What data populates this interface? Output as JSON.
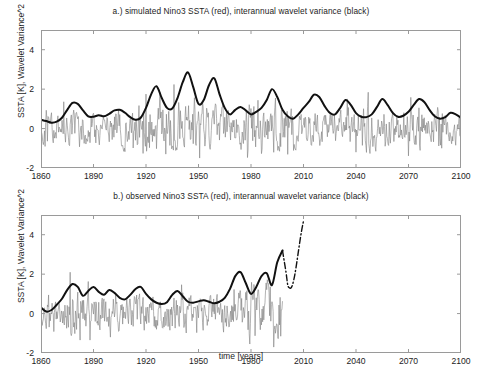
{
  "figure": {
    "width": 482,
    "height": 375,
    "background": "#ffffff",
    "axis_color": "#9a9a9a",
    "text_color": "#1c1c1c"
  },
  "chart_data": [
    {
      "type": "line",
      "panel": "a",
      "title": "a.) simulated Nino3 SSTA (red), interannual wavelet variance (black)",
      "xlabel": "",
      "ylabel": "SSTA [K], Wavelet Variance^2",
      "xlim": [
        1860,
        2100
      ],
      "ylim": [
        -2,
        5
      ],
      "xticks": [
        1860,
        1890,
        1920,
        1950,
        1980,
        2010,
        2040,
        2070,
        2100
      ],
      "yticks": [
        -2,
        0,
        2,
        4
      ],
      "grid": false,
      "legend_position": "none",
      "series": [
        {
          "name": "simulated Nino3 SSTA (red)",
          "color": "#808080",
          "linewidth": 0.6,
          "style": "solid",
          "x_start": 1860,
          "x_end": 2100,
          "dt": 0.3333,
          "description": "High-frequency monthly SSTA noise oscillating roughly between -2 and +3 K",
          "envelope_x": [
            1860,
            1866,
            1872,
            1878,
            1884,
            1890,
            1896,
            1902,
            1908,
            1914,
            1920,
            1926,
            1932,
            1938,
            1944,
            1950,
            1956,
            1962,
            1968,
            1974,
            1980,
            1986,
            1992,
            1998,
            2004,
            2010,
            2016,
            2022,
            2028,
            2034,
            2040,
            2046,
            2052,
            2058,
            2064,
            2070,
            2076,
            2082,
            2088,
            2094,
            2100
          ],
          "envelope_hi": [
            1.0,
            1.1,
            1.3,
            1.9,
            1.5,
            1.4,
            1.3,
            1.6,
            1.5,
            2.1,
            2.2,
            1.7,
            2.3,
            2.9,
            2.3,
            3.1,
            1.8,
            1.9,
            1.6,
            1.5,
            2.2,
            1.7,
            1.6,
            2.0,
            1.9,
            1.6,
            1.5,
            1.4,
            1.6,
            1.8,
            1.5,
            2.0,
            1.7,
            1.5,
            1.6,
            2.0,
            1.5,
            1.5,
            1.9,
            1.6,
            1.2
          ],
          "envelope_lo": [
            -1.1,
            -1.2,
            -1.3,
            -1.5,
            -1.2,
            -1.3,
            -1.2,
            -1.3,
            -1.4,
            -1.7,
            -1.6,
            -1.3,
            -1.9,
            -1.8,
            -1.6,
            -1.9,
            -1.4,
            -1.5,
            -1.3,
            -1.4,
            -1.8,
            -1.3,
            -1.3,
            -1.5,
            -1.4,
            -1.3,
            -1.2,
            -1.2,
            -1.3,
            -1.4,
            -1.3,
            -1.5,
            -1.4,
            -1.2,
            -1.3,
            -1.5,
            -1.3,
            -1.2,
            -1.4,
            -1.3,
            -1.0
          ]
        },
        {
          "name": "interannual wavelet variance (black)",
          "color": "#111111",
          "linewidth": 2.0,
          "style": "solid",
          "x": [
            1860,
            1863,
            1866,
            1869,
            1872,
            1875,
            1878,
            1881,
            1884,
            1887,
            1890,
            1893,
            1896,
            1899,
            1902,
            1905,
            1908,
            1911,
            1914,
            1917,
            1920,
            1923,
            1926,
            1929,
            1932,
            1935,
            1938,
            1941,
            1944,
            1947,
            1950,
            1953,
            1956,
            1959,
            1962,
            1965,
            1968,
            1971,
            1974,
            1977,
            1980,
            1983,
            1986,
            1989,
            1992,
            1995,
            1998,
            2001,
            2004,
            2007,
            2010,
            2013,
            2016,
            2019,
            2022,
            2025,
            2028,
            2031,
            2034,
            2037,
            2040,
            2043,
            2046,
            2049,
            2052,
            2055,
            2058,
            2061,
            2064,
            2067,
            2070,
            2073,
            2076,
            2079,
            2082,
            2085,
            2088,
            2091,
            2094,
            2097,
            2100
          ],
          "y": [
            0.45,
            0.38,
            0.3,
            0.35,
            0.55,
            0.95,
            1.3,
            1.25,
            0.92,
            0.62,
            0.6,
            0.68,
            0.62,
            0.75,
            0.92,
            0.95,
            0.8,
            0.58,
            0.45,
            0.55,
            1.05,
            1.75,
            2.15,
            1.55,
            1.05,
            1.02,
            1.55,
            2.35,
            2.85,
            2.1,
            1.25,
            1.45,
            2.2,
            2.55,
            1.75,
            1.05,
            0.72,
            0.95,
            1.1,
            0.92,
            0.72,
            0.85,
            1.05,
            1.45,
            2.0,
            1.6,
            0.95,
            0.62,
            0.5,
            0.72,
            1.05,
            1.35,
            1.72,
            1.6,
            1.15,
            0.8,
            0.72,
            1.05,
            1.45,
            1.2,
            0.78,
            0.6,
            0.58,
            0.72,
            1.1,
            1.5,
            1.2,
            0.8,
            0.6,
            0.65,
            0.85,
            1.2,
            1.5,
            1.35,
            0.95,
            0.62,
            0.5,
            0.58,
            0.8,
            0.72,
            0.55
          ]
        }
      ]
    },
    {
      "type": "line",
      "panel": "b",
      "title": "b.) observed Nino3 SSTA (red), interannual wavelet variance (black)",
      "xlabel": "time [years]",
      "ylabel": "SSTA [K], Wavelet Variance^2",
      "xlim": [
        1860,
        2100
      ],
      "ylim": [
        -2,
        5
      ],
      "xticks": [
        1860,
        1890,
        1920,
        1950,
        1980,
        2010,
        2040,
        2070,
        2100
      ],
      "yticks": [
        -2,
        0,
        2,
        4
      ],
      "grid": false,
      "legend_position": "none",
      "series": [
        {
          "name": "observed Nino3 SSTA (red)",
          "color": "#808080",
          "linewidth": 0.6,
          "style": "solid",
          "x_start": 1860,
          "x_end": 1998,
          "dt": 0.3333,
          "description": "High-frequency observed monthly SSTA noise, growing amplitude after 1960, record ends ~1998",
          "envelope_x": [
            1860,
            1866,
            1872,
            1878,
            1884,
            1890,
            1896,
            1902,
            1908,
            1914,
            1920,
            1926,
            1932,
            1938,
            1944,
            1950,
            1956,
            1962,
            1968,
            1974,
            1980,
            1986,
            1992,
            1998
          ],
          "envelope_hi": [
            0.8,
            1.0,
            1.1,
            2.7,
            1.5,
            2.2,
            1.4,
            1.9,
            1.3,
            1.8,
            1.4,
            1.2,
            1.4,
            1.9,
            1.3,
            1.1,
            1.2,
            1.4,
            1.5,
            2.0,
            3.2,
            1.9,
            3.8,
            2.0
          ],
          "envelope_lo": [
            -1.0,
            -1.2,
            -1.3,
            -1.4,
            -1.5,
            -1.5,
            -1.3,
            -1.5,
            -1.4,
            -1.4,
            -1.3,
            -1.5,
            -1.4,
            -1.3,
            -1.5,
            -1.4,
            -1.3,
            -1.5,
            -1.4,
            -1.5,
            -1.7,
            -1.5,
            -1.8,
            -1.3
          ]
        },
        {
          "name": "interannual wavelet variance (black)",
          "color": "#111111",
          "linewidth": 2.0,
          "style": "solid",
          "x": [
            1860,
            1863,
            1866,
            1869,
            1872,
            1875,
            1878,
            1881,
            1884,
            1887,
            1890,
            1893,
            1896,
            1899,
            1902,
            1905,
            1908,
            1911,
            1914,
            1917,
            1920,
            1923,
            1926,
            1929,
            1932,
            1935,
            1938,
            1941,
            1944,
            1947,
            1950,
            1953,
            1956,
            1959,
            1962,
            1965,
            1968,
            1971,
            1974,
            1977,
            1980,
            1983,
            1986,
            1989,
            1992,
            1995,
            1998
          ],
          "y": [
            0.3,
            0.1,
            0.18,
            0.45,
            0.75,
            1.2,
            1.5,
            1.35,
            0.9,
            1.15,
            1.35,
            1.1,
            0.95,
            1.2,
            1.05,
            0.8,
            0.72,
            0.95,
            1.25,
            1.35,
            1.0,
            0.72,
            0.55,
            0.48,
            0.58,
            0.95,
            1.15,
            0.88,
            0.6,
            0.55,
            0.62,
            0.68,
            0.6,
            0.52,
            0.6,
            0.8,
            1.25,
            1.9,
            2.1,
            1.55,
            1.0,
            1.35,
            1.9,
            2.05,
            1.45,
            2.6,
            3.2
          ]
        },
        {
          "name": "projected wavelet variance (dash-dot)",
          "color": "#111111",
          "linewidth": 1.4,
          "style": "dashdot",
          "x": [
            1998,
            2000,
            2001,
            2002,
            2003,
            2004,
            2005,
            2006,
            2007,
            2008,
            2009,
            2010
          ],
          "y": [
            3.2,
            2.1,
            1.45,
            1.3,
            1.32,
            1.55,
            1.95,
            2.5,
            3.1,
            3.7,
            4.25,
            4.7
          ]
        }
      ]
    }
  ],
  "panels": {
    "a": {
      "title": "a.) simulated Nino3 SSTA (red), interannual wavelet variance (black)",
      "ylabel": "SSTA [K], Wavelet Variance^2",
      "xlabel": "",
      "xticklabels": [
        "1860",
        "1890",
        "1920",
        "1950",
        "1980",
        "2010",
        "2040",
        "2070",
        "2100"
      ],
      "yticklabels": [
        "4",
        "2",
        "0",
        "-2"
      ]
    },
    "b": {
      "title": "b.) observed Nino3 SSTA (red), interannual wavelet variance (black)",
      "ylabel": "SSTA [K], Wavelet Variance^2",
      "xlabel": "time [years]",
      "xticklabels": [
        "1860",
        "1890",
        "1920",
        "1950",
        "1980",
        "2010",
        "2040",
        "2070",
        "2100"
      ],
      "yticklabels": [
        "4",
        "2",
        "0",
        "-2"
      ]
    }
  },
  "colors": {
    "noise_series": "#808080",
    "variance_series": "#111111",
    "axis": "#9a9a9a",
    "background": "#ffffff"
  }
}
